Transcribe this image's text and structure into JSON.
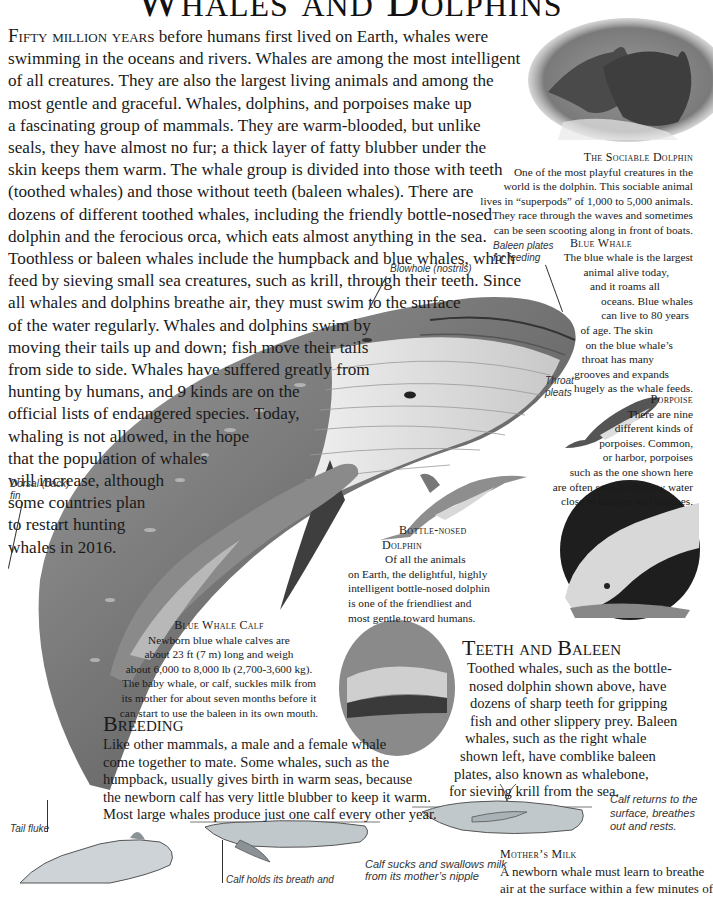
{
  "page": {
    "title": "Whales and Dolphins"
  },
  "intro": {
    "lead": "Fifty million years",
    "lines": [
      " before humans first lived on Earth, whales were",
      "swimming in the oceans and rivers. Whales are among the most intelligent",
      "of all creatures. They are also the largest living animals and among the",
      "most gentle and graceful. Whales, dolphins, and porpoises make up",
      "a fascinating group of mammals. They are warm-blooded, but unlike",
      "seals, they have almost no fur; a thick layer of fatty blubber under the",
      "skin keeps them warm. The whale group is divided into those with teeth",
      "(toothed whales) and those without teeth (baleen whales). There are",
      "dozens of different toothed whales, including the friendly bottle-nosed",
      "dolphin and the ferocious orca, which eats almost anything in the sea.",
      "Toothless or baleen whales include the humpback and blue whales, which",
      "feed by sieving small sea creatures, such as krill, through their teeth. Since",
      "all whales and dolphins breathe air, they must swim to the surface",
      "of the water regularly. Whales and dolphins swim by",
      "moving their tails up and down; fish move their tails",
      "from side to side. Whales have suffered greatly from",
      "hunting by humans, and 9 kinds are on the",
      "official lists of endangered species. Today,",
      "whaling is not allowed, in the hope",
      "that the population of whales",
      "will increase, although",
      "some countries plan",
      "to restart hunting",
      "whales in 2016."
    ]
  },
  "captions": {
    "sociable_dolphin": {
      "title": "The Sociable Dolphin",
      "lines": [
        "One of the most playful creatures in the",
        "world is the dolphin. This sociable animal",
        "lives in “superpods” of 1,000 to 5,000 animals.",
        "They race through the waves and sometimes",
        "can be seen scooting along in front of boats."
      ]
    },
    "blue_whale": {
      "title": "Blue Whale",
      "lines": [
        "The blue whale is the largest",
        "animal alive today,",
        "and it roams all",
        "oceans. Blue whales",
        "can live to 80 years",
        "of age. The skin",
        "on the blue whale’s",
        "throat has many",
        "grooves and expands",
        "hugely as the whale feeds."
      ]
    },
    "porpoise": {
      "title": "Porpoise",
      "lines": [
        "There are nine",
        "different kinds of",
        "porpoises. Common,",
        "or harbor, porpoises",
        "such as the one shown here",
        "are often seen in shallow water",
        "close to harbors and beaches."
      ]
    },
    "bottle_nosed": {
      "title_line1": "Bottle-nosed",
      "title_line2": "Dolphin",
      "lines": [
        "Of all the animals",
        "on Earth, the delightful, highly",
        "intelligent bottle-nosed dolphin",
        "is one of the friendliest and",
        "most gentle toward humans."
      ]
    },
    "blue_whale_calf": {
      "title": "Blue Whale Calf",
      "lines": [
        "Newborn blue whale calves are",
        "about 23 ft (7 m) long and weigh",
        "about 6,000 to 8,000 lb (2,700-3,600 kg).",
        "The baby whale, or calf, suckles milk from",
        "its mother for about seven months before it",
        "can start to use the baleen in its own mouth."
      ]
    },
    "mothers_milk": {
      "title": "Mother’s Milk",
      "lines": [
        "A newborn whale must learn to breathe",
        "air at the surface within a few minutes of"
      ]
    }
  },
  "sections": {
    "teeth_baleen": {
      "heading": "Teeth and Baleen",
      "lines": [
        "Toothed whales, such as the bottle-",
        "nosed dolphin shown above, have",
        "dozens of sharp teeth for gripping",
        "fish and other slippery prey. Baleen",
        "whales, such as the right whale",
        "shown left, have comblike baleen",
        "plates, also known as whalebone,",
        "for sieving krill from the sea."
      ]
    },
    "breeding": {
      "heading": "Breeding",
      "lines": [
        "Like other mammals, a male and a female whale",
        "come together to mate. Some whales, such as the",
        "humpback, usually gives birth in warm seas, because",
        "the newborn calf has very little blubber to keep it warm.",
        "Most large whales produce just one calf every other year."
      ]
    }
  },
  "labels": {
    "baleen_plates": [
      "Baleen plates",
      "for feeding"
    ],
    "blowhole": "Blowhole (nostrils)",
    "throat_pleats": [
      "Throat",
      "pleats"
    ],
    "dorsal_fin": [
      "Dorsal (back)",
      "fin"
    ],
    "tail_fluke": "Tail fluke",
    "calf_holds": "Calf holds its breath and",
    "calf_sucks": [
      "Calf sucks and swallows milk",
      "from its mother’s nipple"
    ],
    "calf_returns": [
      "Calf returns to the",
      "surface, breathes",
      "out and rests."
    ]
  },
  "colors": {
    "text": "#1a1a1a",
    "whale_dark": "#5a5a5a",
    "whale_mid": "#8c8c8c",
    "whale_light": "#d4d4d4",
    "photo_dark": "#2a2a2a"
  }
}
